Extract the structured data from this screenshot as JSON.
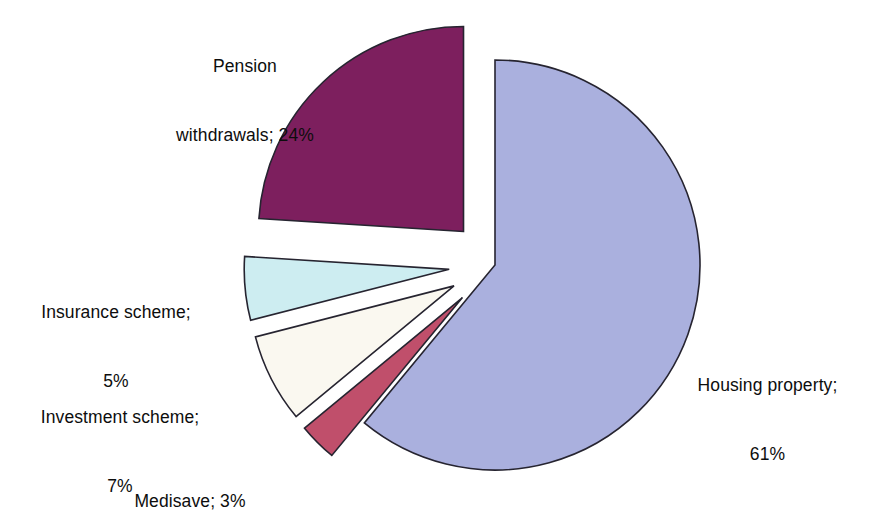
{
  "chart_data": {
    "type": "pie",
    "title": "",
    "subtitle": "",
    "xlabel": "",
    "ylabel": "",
    "legend_position": "none",
    "grid": false,
    "label_format": "name; value%",
    "units": "percent",
    "total": 100,
    "categories": [
      "Housing property",
      "Medisave",
      "Investment scheme",
      "Insurance scheme",
      "Pension withdrawals"
    ],
    "values": [
      61,
      3,
      7,
      5,
      24
    ],
    "colors": [
      "#aab0de",
      "#c04f6b",
      "#faf8f0",
      "#cdedf1",
      "#7d1f5e"
    ],
    "slices": [
      {
        "name": "housing-property",
        "label": "Housing property;",
        "value_label": "61%",
        "value": 61,
        "color": "#aab0de",
        "exploded": false
      },
      {
        "name": "medisave",
        "label": "Medisave; 3%",
        "value_label": "3%",
        "value": 3,
        "color": "#c04f6b",
        "exploded": true
      },
      {
        "name": "investment-scheme",
        "label": "Investment scheme;",
        "value_label": "7%",
        "value": 7,
        "color": "#faf8f0",
        "exploded": true
      },
      {
        "name": "insurance-scheme",
        "label": "Insurance scheme;",
        "value_label": "5%",
        "value": 5,
        "color": "#cdedf1",
        "exploded": true
      },
      {
        "name": "pension-withdrawals",
        "label": "Pension",
        "value_label": "24%",
        "value": 24,
        "color": "#7d1f5e",
        "exploded": true
      }
    ]
  },
  "labels": {
    "pension_line1": "Pension",
    "pension_line2": "withdrawals; 24%",
    "insurance_line1": "Insurance scheme;",
    "insurance_line2": "5%",
    "investment_line1": "Investment scheme;",
    "investment_line2": "7%",
    "medisave_line1": "Medisave; 3%",
    "housing_line1": "Housing property;",
    "housing_line2": "61%"
  },
  "style": {
    "background": "#ffffff",
    "outline": "#262430",
    "text": "#0d0d0d"
  }
}
